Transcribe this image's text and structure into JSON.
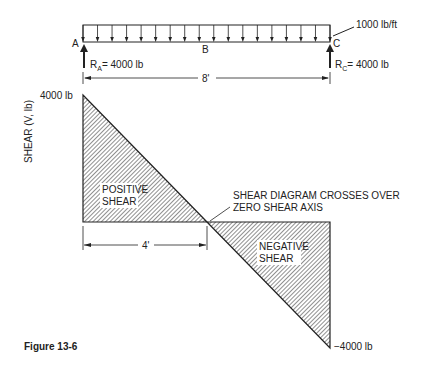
{
  "beam": {
    "load_label": "1000 lb/ft",
    "point_a": "A",
    "point_b": "B",
    "point_c": "C",
    "reaction_a": {
      "prefix": "R",
      "sub": "A",
      "value": "= 4000 lb"
    },
    "reaction_c": {
      "prefix": "R",
      "sub": "C",
      "value": "= 4000 lb"
    },
    "span_label": "8'",
    "load_arrow_count": 17
  },
  "shear_diagram": {
    "axis_label": "SHEAR (V, lb)",
    "max_label": "4000 lb",
    "min_label": "−4000 lb",
    "positive_label": [
      "POSITIVE",
      "SHEAR"
    ],
    "negative_label": [
      "NEGATIVE",
      "SHEAR"
    ],
    "crossover_note": [
      "SHEAR DIAGRAM CROSSES OVER",
      "ZERO SHEAR AXIS"
    ],
    "half_span_label": "4'",
    "span_ft": 8,
    "max_shear_lb": 4000,
    "min_shear_lb": -4000,
    "zero_cross_ft": 4
  },
  "caption": "Figure 13-6"
}
